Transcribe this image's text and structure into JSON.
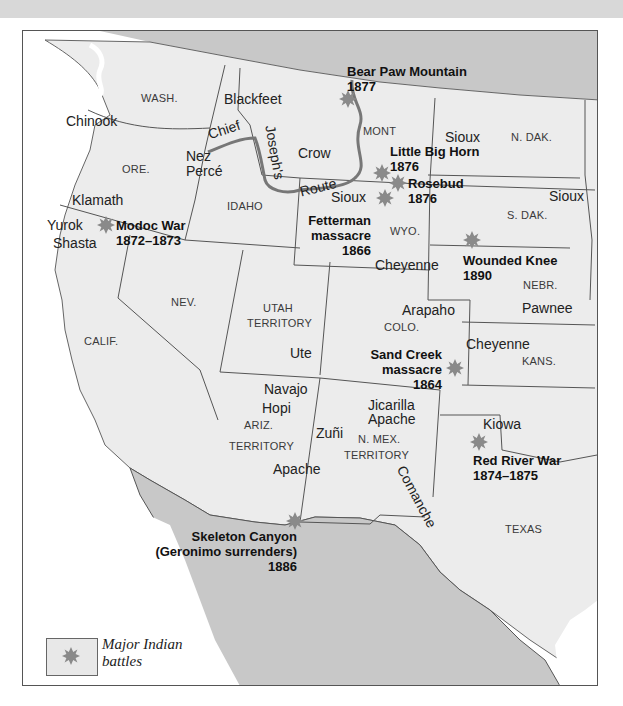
{
  "map": {
    "title": "Major Indian battles in the American West",
    "colors": {
      "us_land": "#ececec",
      "foreign_land": "#c8c8c8",
      "water": "#ffffff",
      "border": "#555555",
      "route": "#777777",
      "battle_marker": "#8a8a8a"
    },
    "states": [
      {
        "id": "wash",
        "label": "WASH."
      },
      {
        "id": "ore",
        "label": "ORE."
      },
      {
        "id": "idaho",
        "label": "IDAHO"
      },
      {
        "id": "mont",
        "label": "MONT"
      },
      {
        "id": "wyo",
        "label": "WYO."
      },
      {
        "id": "ndak",
        "label": "N. DAK."
      },
      {
        "id": "sdak",
        "label": "S. DAK."
      },
      {
        "id": "nebr",
        "label": "NEBR."
      },
      {
        "id": "nev",
        "label": "NEV."
      },
      {
        "id": "calif",
        "label": "CALIF."
      },
      {
        "id": "utah_1",
        "label": "UTAH"
      },
      {
        "id": "utah_2",
        "label": "TERRITORY"
      },
      {
        "id": "colo",
        "label": "COLO."
      },
      {
        "id": "kans",
        "label": "KANS."
      },
      {
        "id": "ariz_1",
        "label": "ARIZ."
      },
      {
        "id": "ariz_2",
        "label": "TERRITORY"
      },
      {
        "id": "nmex_1",
        "label": "N. MEX."
      },
      {
        "id": "nmex_2",
        "label": "TERRITORY"
      },
      {
        "id": "texas",
        "label": "TEXAS"
      }
    ],
    "tribes": [
      {
        "id": "chinook",
        "label": "Chinook"
      },
      {
        "id": "blackfeet",
        "label": "Blackfeet"
      },
      {
        "id": "nez",
        "label": "Nez"
      },
      {
        "id": "perce",
        "label": "Percé"
      },
      {
        "id": "crow",
        "label": "Crow"
      },
      {
        "id": "sioux_1",
        "label": "Sioux"
      },
      {
        "id": "sioux_2",
        "label": "Sioux"
      },
      {
        "id": "sioux_3",
        "label": "Sioux"
      },
      {
        "id": "klamath",
        "label": "Klamath"
      },
      {
        "id": "yurok",
        "label": "Yurok"
      },
      {
        "id": "shasta",
        "label": "Shasta"
      },
      {
        "id": "cheyenne_1",
        "label": "Cheyenne"
      },
      {
        "id": "cheyenne_2",
        "label": "Cheyenne"
      },
      {
        "id": "arapaho",
        "label": "Arapaho"
      },
      {
        "id": "pawnee",
        "label": "Pawnee"
      },
      {
        "id": "ute",
        "label": "Ute"
      },
      {
        "id": "navajo",
        "label": "Navajo"
      },
      {
        "id": "hopi",
        "label": "Hopi"
      },
      {
        "id": "jicarilla",
        "label": "Jicarilla"
      },
      {
        "id": "jicarilla_apache",
        "label": "Apache"
      },
      {
        "id": "zuni",
        "label": "Zuñi"
      },
      {
        "id": "apache",
        "label": "Apache"
      },
      {
        "id": "kiowa",
        "label": "Kiowa"
      },
      {
        "id": "comanche",
        "label": "Comanche"
      }
    ],
    "route": {
      "words": [
        "Chief",
        "Joseph's",
        "Route"
      ]
    },
    "battles": [
      {
        "id": "bear_paw",
        "name": "Bear Paw Mountain",
        "year": "1877"
      },
      {
        "id": "little_big_horn",
        "name": "Little Big Horn",
        "year": "1876"
      },
      {
        "id": "rosebud",
        "name": "Rosebud",
        "year": "1876"
      },
      {
        "id": "fetterman",
        "name": "Fetterman",
        "name2": "massacre",
        "year": "1866"
      },
      {
        "id": "modoc",
        "name": "Modoc War",
        "year": "1872–1873"
      },
      {
        "id": "wounded_knee",
        "name": "Wounded Knee",
        "year": "1890"
      },
      {
        "id": "sand_creek",
        "name": "Sand Creek",
        "name2": "massacre",
        "year": "1864"
      },
      {
        "id": "red_river",
        "name": "Red River War",
        "year": "1874–1875"
      },
      {
        "id": "skeleton_canyon",
        "name": "Skeleton Canyon",
        "name2": "(Geronimo surrenders)",
        "year": "1886"
      }
    ],
    "legend": {
      "line1": "Major Indian",
      "line2": "battles"
    }
  }
}
